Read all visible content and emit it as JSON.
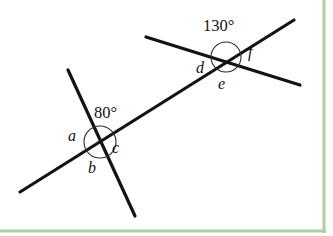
{
  "figure": {
    "canvas": {
      "width": 333,
      "height": 236
    },
    "background_color": "#ffffff",
    "line_color": "#131313",
    "arc_color": "#2b2b2b",
    "border_color": "#a9cfa3"
  },
  "lines": [
    {
      "name": "transversal",
      "x1": 20,
      "y1": 192,
      "x2": 294,
      "y2": 20
    },
    {
      "name": "lower-steep-line",
      "x1": 68,
      "y1": 70,
      "x2": 135,
      "y2": 216
    },
    {
      "name": "upper-shallow-line",
      "x1": 146,
      "y1": 37,
      "x2": 300,
      "y2": 85
    }
  ],
  "intersections": [
    {
      "name": "lower-intersection",
      "cx": 100,
      "cy": 142,
      "arc_radius": 16,
      "angle_measure": "80°",
      "labels": [
        "a",
        "b",
        "c"
      ]
    },
    {
      "name": "upper-intersection",
      "cx": 226,
      "cy": 57,
      "arc_radius": 15,
      "angle_measure": "130°",
      "labels": [
        "d",
        "e",
        "f"
      ]
    }
  ],
  "labels": {
    "a": "a",
    "b": "b",
    "c": "c",
    "d": "d",
    "e": "e",
    "f": "f",
    "angle_80": "80°",
    "angle_130": "130°"
  },
  "borders": {
    "right_rule_x": 324,
    "bottom_rule_y": 231,
    "rule_width": 3
  }
}
